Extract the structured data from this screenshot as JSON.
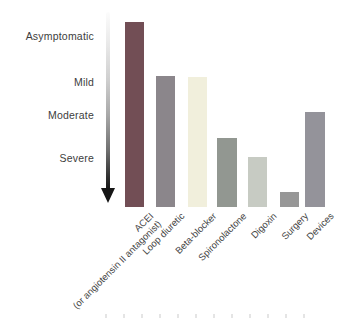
{
  "chart_data": {
    "type": "bar",
    "title": "",
    "orientation": "vertical",
    "description_visible_text_only": "Bar chart of heart failure treatments vs disease severity; a fading arrow axis points downward from Asymptomatic to Severe",
    "y_axis": {
      "tick_labels": [
        "Asymptomatic",
        "Mild",
        "Moderate",
        "Severe"
      ],
      "tick_y_px": [
        36,
        82,
        115,
        158
      ],
      "arrow_direction": "down",
      "arrow_gradient": [
        "#fcfcfc",
        "#141414"
      ]
    },
    "categories": [
      "ACEI (or angiotensin II antagonist)",
      "Loop diuretic",
      "Beta-blocker",
      "Spironolactone",
      "Digoxin",
      "Surgery",
      "Devices"
    ],
    "values_severity_reach": [
      "Asymptomatic",
      "Mild",
      "Mild",
      "Moderate",
      "Severe",
      "Severe",
      "Moderate"
    ],
    "values_normalized": [
      1.0,
      0.71,
      0.7,
      0.37,
      0.27,
      0.08,
      0.51
    ],
    "baseline_y_px": 207,
    "bars": [
      {
        "slug": "acei",
        "label": "ACEI\n(or angiotensin II antagonist)",
        "color": "#724e55",
        "left_px": 125,
        "width_px": 19,
        "top_px": 22,
        "height_px": 185
      },
      {
        "slug": "loop-diuretic",
        "label": "Loop diuretic",
        "color": "#8b868b",
        "left_px": 156,
        "width_px": 19,
        "top_px": 76,
        "height_px": 131
      },
      {
        "slug": "beta-blocker",
        "label": "Beta-blocker",
        "color": "#f1efdc",
        "left_px": 188,
        "width_px": 19,
        "top_px": 77,
        "height_px": 130
      },
      {
        "slug": "spironolactone",
        "label": "Spironolactone",
        "color": "#929791",
        "left_px": 217,
        "width_px": 20,
        "top_px": 138,
        "height_px": 69
      },
      {
        "slug": "digoxin",
        "label": "Digoxin",
        "color": "#c7cbc3",
        "left_px": 248,
        "width_px": 19,
        "top_px": 157,
        "height_px": 50
      },
      {
        "slug": "surgery",
        "label": "Surgery",
        "color": "#979797",
        "left_px": 280,
        "width_px": 19,
        "top_px": 192,
        "height_px": 15
      },
      {
        "slug": "devices",
        "label": "Devices",
        "color": "#94939a",
        "left_px": 305,
        "width_px": 20,
        "top_px": 112,
        "height_px": 95
      }
    ],
    "legend": null,
    "grid": false
  },
  "text_colors": {
    "y_labels": "#3d3d3d",
    "x_labels": "#454545"
  }
}
